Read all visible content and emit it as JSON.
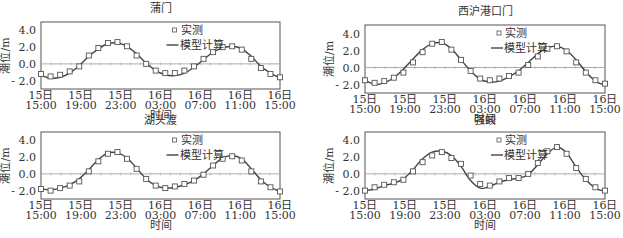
{
  "chart_data": [
    {
      "type": "line",
      "title": "蒲门",
      "xlabel": "时间",
      "ylabel": "潮位/m",
      "ylim": [
        -3.0,
        5.0
      ],
      "yticks": [
        "4.0",
        "2.0",
        "0.0",
        "-2.0"
      ],
      "xticks": [
        [
          "15日",
          "15:00"
        ],
        [
          "15日",
          "19:00"
        ],
        [
          "15日",
          "23:00"
        ],
        [
          "16日",
          "03:00"
        ],
        [
          "16日",
          "07:00"
        ],
        [
          "16日",
          "11:00"
        ],
        [
          "16日",
          "15:00"
        ]
      ],
      "legend": [
        "实测",
        "模型计算"
      ],
      "x_hours": [
        0,
        1,
        2,
        3,
        4,
        5,
        6,
        7,
        8,
        9,
        10,
        11,
        12,
        13,
        14,
        15,
        16,
        17,
        18,
        19,
        20,
        21,
        22,
        23,
        24
      ],
      "series": [
        {
          "name": "实测",
          "style": "square-marker",
          "values": [
            -1.2,
            -1.5,
            -1.3,
            -0.9,
            -0.3,
            1.0,
            1.9,
            2.5,
            2.6,
            2.1,
            1.0,
            0.0,
            -0.8,
            -1.1,
            -1.1,
            -0.8,
            -0.3,
            0.6,
            1.4,
            2.0,
            2.1,
            1.7,
            0.6,
            -0.5,
            -1.2,
            -1.6
          ]
        },
        {
          "name": "模型计算",
          "style": "line",
          "values": [
            -1.4,
            -1.7,
            -1.6,
            -1.1,
            -0.2,
            0.9,
            1.8,
            2.4,
            2.5,
            2.1,
            1.2,
            0.1,
            -0.8,
            -1.3,
            -1.4,
            -1.1,
            -0.4,
            0.5,
            1.4,
            1.9,
            2.1,
            1.8,
            0.9,
            -0.3,
            -1.1,
            -1.7
          ]
        }
      ]
    },
    {
      "type": "line",
      "title": "西沪港口门",
      "xlabel": "时间",
      "ylabel": "潮位/m",
      "ylim": [
        -3.0,
        5.0
      ],
      "yticks": [
        "4.0",
        "2.0",
        "0.0",
        "-2.0"
      ],
      "xticks": [
        [
          "15日",
          "15:00"
        ],
        [
          "15日",
          "19:00"
        ],
        [
          "15日",
          "23:00"
        ],
        [
          "16日",
          "03:00"
        ],
        [
          "16日",
          "07:00"
        ],
        [
          "16日",
          "11:00"
        ],
        [
          "16日",
          "15:00"
        ]
      ],
      "legend": [
        "实测",
        "模型计算"
      ],
      "x_hours": [
        0,
        1,
        2,
        3,
        4,
        5,
        6,
        7,
        8,
        9,
        10,
        11,
        12,
        13,
        14,
        15,
        16,
        17,
        18,
        19,
        20,
        21,
        22,
        23,
        24
      ],
      "series": [
        {
          "name": "实测",
          "style": "square-marker",
          "values": [
            -1.5,
            -1.8,
            -1.6,
            -1.2,
            -0.6,
            0.6,
            1.8,
            2.8,
            3.0,
            2.1,
            0.9,
            -0.4,
            -1.3,
            -1.5,
            -1.3,
            -1.0,
            -0.6,
            0.3,
            1.3,
            2.2,
            2.5,
            1.9,
            0.6,
            -0.6,
            -1.5,
            -1.9
          ]
        },
        {
          "name": "模型计算",
          "style": "line",
          "values": [
            -1.5,
            -2.0,
            -1.8,
            -1.2,
            -0.2,
            1.0,
            2.1,
            2.8,
            2.9,
            2.2,
            0.9,
            -0.4,
            -1.4,
            -1.7,
            -1.6,
            -1.1,
            -0.4,
            0.6,
            1.6,
            2.3,
            2.5,
            2.0,
            0.9,
            -0.5,
            -1.6,
            -2.1
          ]
        }
      ]
    },
    {
      "type": "line",
      "title": "湖头渡",
      "xlabel": "时间",
      "ylabel": "潮位/m",
      "ylim": [
        -3.0,
        5.0
      ],
      "yticks": [
        "4.0",
        "2.0",
        "0.0",
        "-2.0"
      ],
      "xticks": [
        [
          "15日",
          "15:00"
        ],
        [
          "15日",
          "19:00"
        ],
        [
          "15日",
          "23:00"
        ],
        [
          "16日",
          "03:00"
        ],
        [
          "16日",
          "07:00"
        ],
        [
          "16日",
          "11:00"
        ],
        [
          "16日",
          "15:00"
        ]
      ],
      "legend": [
        "实测",
        "模型计算"
      ],
      "x_hours": [
        0,
        1,
        2,
        3,
        4,
        5,
        6,
        7,
        8,
        9,
        10,
        11,
        12,
        13,
        14,
        15,
        16,
        17,
        18,
        19,
        20,
        21,
        22,
        23,
        24
      ],
      "series": [
        {
          "name": "实测",
          "style": "square-marker",
          "values": [
            -1.8,
            -2.0,
            -1.7,
            -1.4,
            -0.9,
            0.3,
            1.5,
            2.4,
            2.6,
            1.8,
            0.6,
            -0.6,
            -1.4,
            -1.7,
            -1.5,
            -1.2,
            -0.8,
            -0.1,
            1.0,
            1.8,
            2.1,
            1.6,
            0.3,
            -0.9,
            -1.6,
            -2.1
          ]
        },
        {
          "name": "模型计算",
          "style": "line",
          "values": [
            -1.8,
            -1.9,
            -1.7,
            -1.3,
            -0.6,
            0.5,
            1.7,
            2.5,
            2.5,
            1.9,
            0.7,
            -0.6,
            -1.4,
            -1.7,
            -1.6,
            -1.3,
            -0.8,
            0.0,
            1.0,
            1.9,
            2.2,
            1.8,
            0.6,
            -0.7,
            -1.6,
            -2.1
          ]
        }
      ]
    },
    {
      "type": "line",
      "title": "强蛟",
      "xlabel": "时间",
      "ylabel": "潮位/m",
      "ylim": [
        -3.0,
        5.0
      ],
      "yticks": [
        "4.0",
        "2.0",
        "0.0",
        "-2.0"
      ],
      "xticks": [
        [
          "15日",
          "15:00"
        ],
        [
          "15日",
          "19:00"
        ],
        [
          "15日",
          "23:00"
        ],
        [
          "16日",
          "03:00"
        ],
        [
          "16日",
          "07:00"
        ],
        [
          "16日",
          "11:00"
        ],
        [
          "16日",
          "15:00"
        ]
      ],
      "legend": [
        "实测",
        "模型计算"
      ],
      "x_hours": [
        0,
        1,
        2,
        3,
        4,
        5,
        6,
        7,
        8,
        9,
        10,
        11,
        12,
        13,
        14,
        15,
        16,
        17,
        18,
        19,
        20,
        21,
        22,
        23,
        24
      ],
      "series": [
        {
          "name": "实测",
          "style": "square-marker",
          "values": [
            -2.0,
            -1.6,
            -1.3,
            -1.0,
            -0.7,
            0.3,
            1.4,
            2.2,
            2.6,
            1.9,
            1.2,
            -0.2,
            -1.2,
            -1.4,
            -0.9,
            -0.5,
            -0.5,
            0.0,
            1.3,
            2.7,
            3.2,
            2.4,
            0.7,
            -0.6,
            -1.6,
            -2.0
          ]
        },
        {
          "name": "模型计算",
          "style": "line",
          "values": [
            -2.0,
            -1.8,
            -1.4,
            -1.1,
            -0.6,
            0.5,
            1.8,
            2.6,
            2.7,
            2.2,
            0.9,
            -0.8,
            -1.7,
            -1.5,
            -1.0,
            -0.7,
            -0.5,
            -0.1,
            1.1,
            2.4,
            3.2,
            2.5,
            0.8,
            -0.7,
            -1.7,
            -2.1
          ]
        }
      ]
    }
  ]
}
